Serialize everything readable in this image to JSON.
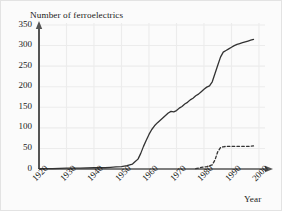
{
  "chart_data": {
    "type": "line",
    "title": "Number of ferroelectrics",
    "xlabel": "Year",
    "ylabel": "",
    "xlim": [
      1920,
      2000
    ],
    "ylim": [
      0,
      350
    ],
    "grid": true,
    "legend": "none",
    "yticks": [
      0,
      50,
      100,
      150,
      200,
      250,
      300,
      350
    ],
    "xticks": [
      1920,
      1930,
      1940,
      1950,
      1960,
      1970,
      1980,
      1990,
      2000
    ],
    "ytick_labels": [
      "0",
      "50",
      "100",
      "150",
      "200",
      "250",
      "300",
      "350"
    ],
    "xtick_labels": [
      "1920",
      "1930",
      "1940",
      "1950",
      "1960",
      "1970",
      "1980",
      "1990",
      "2000"
    ],
    "series": [
      {
        "name": "all ferroelectrics",
        "style": "solid",
        "color": "#333333",
        "x": [
          1920,
          1925,
          1930,
          1935,
          1940,
          1944,
          1946,
          1948,
          1950,
          1952,
          1954,
          1955,
          1956,
          1957,
          1958,
          1959,
          1960,
          1961,
          1962,
          1963,
          1964,
          1965,
          1966,
          1967,
          1968,
          1969,
          1970,
          1971,
          1972,
          1973,
          1974,
          1975,
          1976,
          1977,
          1978,
          1979,
          1980,
          1981,
          1982,
          1983,
          1984,
          1985,
          1986,
          1987,
          1988,
          1989,
          1990,
          1991,
          1992,
          1993,
          1994,
          1995,
          1996,
          1997,
          1998
        ],
        "y": [
          1,
          1,
          2,
          2,
          3,
          3,
          4,
          5,
          6,
          8,
          12,
          18,
          24,
          38,
          55,
          70,
          84,
          96,
          105,
          112,
          118,
          124,
          130,
          136,
          140,
          139,
          142,
          148,
          152,
          158,
          162,
          168,
          172,
          178,
          182,
          188,
          194,
          199,
          202,
          212,
          232,
          252,
          272,
          284,
          288,
          292,
          296,
          300,
          303,
          305,
          307,
          309,
          311,
          313,
          315
        ]
      },
      {
        "name": "subset",
        "style": "dashed",
        "color": "#333333",
        "x": [
          1977,
          1978,
          1979,
          1980,
          1981,
          1982,
          1983,
          1984,
          1985,
          1986,
          1987,
          1988,
          1990,
          1992,
          1994,
          1996,
          1998
        ],
        "y": [
          1,
          2,
          4,
          5,
          6,
          8,
          10,
          22,
          42,
          52,
          54,
          55,
          55,
          55,
          55,
          55,
          56
        ]
      }
    ]
  },
  "axes": {
    "x_arrow": "arrow-right",
    "y_arrow": "arrow-up"
  }
}
